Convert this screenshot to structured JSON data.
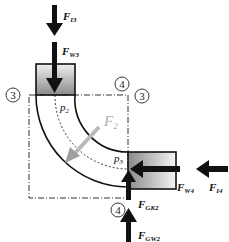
{
  "diagram": {
    "type": "pipe-bend-force-diagram",
    "forces": {
      "F_I3": {
        "main": "F",
        "sub": "I3"
      },
      "F_W3": {
        "main": "F",
        "sub": "W3"
      },
      "F_W4": {
        "main": "F",
        "sub": "W4"
      },
      "F_I4": {
        "main": "F",
        "sub": "I4"
      },
      "F_GK2": {
        "main": "F",
        "sub": "GK2"
      },
      "F_GW2": {
        "main": "F",
        "sub": "GW2"
      },
      "F_2": {
        "main": "F",
        "sub": "2"
      }
    },
    "pressures": {
      "p2": {
        "main": "p",
        "sub": "2"
      },
      "p3": {
        "main": "p",
        "sub": "3"
      }
    },
    "sections": {
      "left_3": "3",
      "top_4": "4",
      "right_3": "3",
      "bottom_4": "4"
    },
    "colors": {
      "line": "#111111",
      "box_gradient_dark": "#8a8a8a",
      "box_gradient_light": "#f2f2f2",
      "resultant_arrow": "#a8a8a8",
      "resultant_label": "#b0b0b0"
    }
  }
}
